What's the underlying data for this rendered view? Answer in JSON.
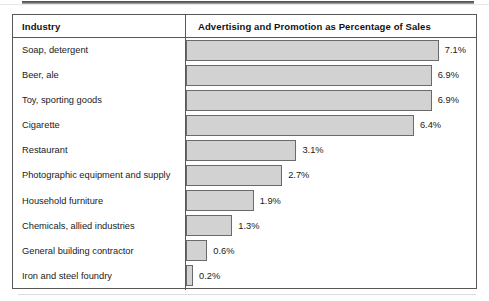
{
  "table": {
    "columns": {
      "industry": "Industry",
      "metric": "Advertising and Promotion as Percentage of Sales"
    }
  },
  "chart_data": {
    "type": "bar",
    "orientation": "horizontal",
    "title": "Advertising and Promotion as Percentage of Sales",
    "xlabel": "Advertising and Promotion as Percentage of Sales",
    "ylabel": "Industry",
    "xlim": [
      0,
      8.2
    ],
    "grid": false,
    "legend": null,
    "unit": "%",
    "bar_fill_color": "#d2d2d2",
    "bar_border_color": "#6a6a6a",
    "categories": [
      "Soap, detergent",
      "Beer, ale",
      "Toy, sporting goods",
      "Cigarette",
      "Restaurant",
      "Photographic equipment and supply",
      "Household furniture",
      "Chemicals, allied industries",
      "General building contractor",
      "Iron and steel foundry"
    ],
    "values": [
      7.1,
      6.9,
      6.9,
      6.4,
      3.1,
      2.7,
      1.9,
      1.3,
      0.6,
      0.2
    ],
    "labels": [
      "7.1%",
      "6.9%",
      "6.9%",
      "6.4%",
      "3.1%",
      "2.7%",
      "1.9%",
      "1.3%",
      "0.6%",
      "0.2%"
    ]
  }
}
